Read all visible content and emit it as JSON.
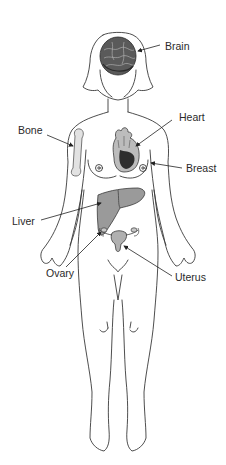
{
  "diagram": {
    "type": "anatomical-figure",
    "colors": {
      "outline": "#3a3a3a",
      "organ_fill": "#9a9a9a",
      "organ_dark": "#4a4a4a",
      "text": "#2a2a2a",
      "background": "#ffffff"
    }
  },
  "labels": {
    "brain": "Brain",
    "heart": "Heart",
    "bone": "Bone",
    "breast": "Breast",
    "liver": "Liver",
    "ovary": "Ovary",
    "uterus": "Uterus"
  }
}
